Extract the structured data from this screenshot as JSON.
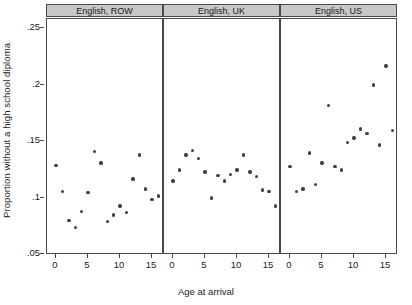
{
  "chart_data": {
    "type": "scatter",
    "title": "",
    "xlabel": "Age at arrival",
    "ylabel": "Proportion without a high school diploma",
    "xlim": [
      -1.5,
      18.5
    ],
    "ylim": [
      0.045,
      0.258
    ],
    "xticks": [
      0,
      5,
      10,
      15
    ],
    "xticklabels": [
      "0",
      "5",
      "10",
      "15"
    ],
    "yticks": [
      0.05,
      0.1,
      0.15,
      0.2,
      0.25
    ],
    "yticklabels": [
      ".05",
      ".1",
      ".15",
      ".2",
      ".25"
    ],
    "grid": false,
    "legend": null,
    "marker_color": "#404040",
    "panel_header_color": "#c8c8c8",
    "axis_color": "#4a4a4a",
    "panels": [
      {
        "label": "English, ROW",
        "points": [
          {
            "x": 0,
            "y": 0.1285
          },
          {
            "x": 1,
            "y": 0.1055
          },
          {
            "x": 2,
            "y": 0.0795
          },
          {
            "x": 3,
            "y": 0.0735
          },
          {
            "x": 4,
            "y": 0.0875
          },
          {
            "x": 5,
            "y": 0.1045
          },
          {
            "x": 6,
            "y": 0.1405
          },
          {
            "x": 7,
            "y": 0.1305
          },
          {
            "x": 8,
            "y": 0.0785
          },
          {
            "x": 9,
            "y": 0.0845
          },
          {
            "x": 10,
            "y": 0.0925
          },
          {
            "x": 11,
            "y": 0.0865
          },
          {
            "x": 12,
            "y": 0.1165
          },
          {
            "x": 13,
            "y": 0.1375
          },
          {
            "x": 14,
            "y": 0.1075
          },
          {
            "x": 15,
            "y": 0.0985
          },
          {
            "x": 16,
            "y": 0.1015
          },
          {
            "x": 17,
            "y": 0.0995
          }
        ]
      },
      {
        "label": "English, UK",
        "points": [
          {
            "x": 0,
            "y": 0.1145
          },
          {
            "x": 1,
            "y": 0.1245
          },
          {
            "x": 2,
            "y": 0.1375
          },
          {
            "x": 3,
            "y": 0.1415
          },
          {
            "x": 4,
            "y": 0.1345
          },
          {
            "x": 5,
            "y": 0.1225
          },
          {
            "x": 6,
            "y": 0.0995
          },
          {
            "x": 7,
            "y": 0.1195
          },
          {
            "x": 8,
            "y": 0.1145
          },
          {
            "x": 9,
            "y": 0.1205
          },
          {
            "x": 10,
            "y": 0.1245
          },
          {
            "x": 11,
            "y": 0.1375
          },
          {
            "x": 12,
            "y": 0.1225
          },
          {
            "x": 13,
            "y": 0.1185
          },
          {
            "x": 14,
            "y": 0.1065
          },
          {
            "x": 15,
            "y": 0.1055
          },
          {
            "x": 16,
            "y": 0.0925
          },
          {
            "x": 17,
            "y": 0.1015
          }
        ]
      },
      {
        "label": "English, US",
        "points": [
          {
            "x": 0,
            "y": 0.1275
          },
          {
            "x": 1,
            "y": 0.1055
          },
          {
            "x": 2,
            "y": 0.1075
          },
          {
            "x": 3,
            "y": 0.1395
          },
          {
            "x": 4,
            "y": 0.1115
          },
          {
            "x": 5,
            "y": 0.1305
          },
          {
            "x": 6,
            "y": 0.1815
          },
          {
            "x": 7,
            "y": 0.1275
          },
          {
            "x": 8,
            "y": 0.1245
          },
          {
            "x": 9,
            "y": 0.1485
          },
          {
            "x": 10,
            "y": 0.1525
          },
          {
            "x": 11,
            "y": 0.1605
          },
          {
            "x": 12,
            "y": 0.1565
          },
          {
            "x": 13,
            "y": 0.1995
          },
          {
            "x": 14,
            "y": 0.1465
          },
          {
            "x": 15,
            "y": 0.2165
          },
          {
            "x": 16,
            "y": 0.1595
          },
          {
            "x": 17,
            "y": 0.1295
          }
        ]
      }
    ]
  }
}
